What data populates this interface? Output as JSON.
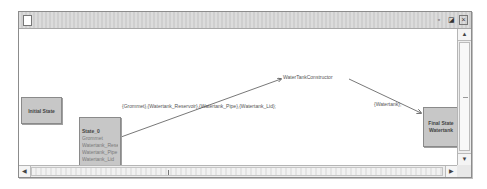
{
  "window": {
    "title": "",
    "controls": {
      "minimize": "▫",
      "maximize": "◪",
      "close": "×"
    }
  },
  "diagram": {
    "initial_state": {
      "label": "Initial State"
    },
    "state_0": {
      "title": "State_0",
      "variables": [
        "Grommet",
        "Watertank_Reservoir",
        "Watertank_Pipe",
        "Watertank_Lid"
      ]
    },
    "transition_1": {
      "label": "{Grommet},{Watertank_Reservoir},{Watertank_Pipe},{Watertank_Lid};"
    },
    "operation_node": {
      "label": "WaterTankConstructor"
    },
    "transition_2": {
      "label": "{Watertank};"
    },
    "final_state": {
      "line1": "Final State",
      "line2": "Watertank"
    }
  },
  "scrollbars": {
    "vertical": {
      "up": "▲",
      "down": "▼"
    },
    "horizontal": {
      "left": "◀",
      "right": "▶"
    }
  }
}
